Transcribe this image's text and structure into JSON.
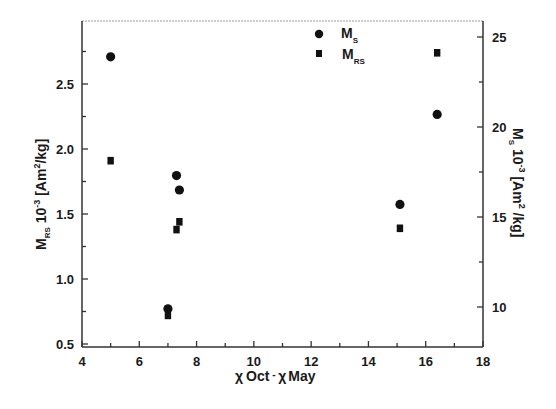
{
  "chart_data": {
    "type": "scatter",
    "title": "",
    "xlabel": "χ Oct - χ May",
    "ylabel_left": "M_RS 10^-3 [Am²/kg]",
    "ylabel_right": "M_S 10^-3 [Am²/kg]",
    "xlim": [
      4,
      18
    ],
    "ylim_left": [
      0.5,
      3.0
    ],
    "ylim_right": [
      8.3,
      26.3
    ],
    "x_ticks": [
      4,
      6,
      8,
      10,
      12,
      14,
      16,
      18
    ],
    "y_left_ticks": [
      0.5,
      1.0,
      1.5,
      2.0,
      2.5
    ],
    "y_right_ticks": [
      10,
      15,
      20,
      25
    ],
    "grid": false,
    "legend_position": "top-center-right",
    "series": [
      {
        "name": "M_S",
        "marker": "circle",
        "axis": "right",
        "points": [
          {
            "x": 5.0,
            "y": 23.9
          },
          {
            "x": 7.3,
            "y": 17.3
          },
          {
            "x": 7.4,
            "y": 16.5
          },
          {
            "x": 7.0,
            "y": 9.9
          },
          {
            "x": 15.1,
            "y": 15.7
          },
          {
            "x": 16.4,
            "y": 20.7
          }
        ]
      },
      {
        "name": "M_RS",
        "marker": "square",
        "axis": "left",
        "points": [
          {
            "x": 5.0,
            "y": 1.91
          },
          {
            "x": 7.3,
            "y": 1.38
          },
          {
            "x": 7.4,
            "y": 1.44
          },
          {
            "x": 7.0,
            "y": 0.72
          },
          {
            "x": 15.1,
            "y": 1.39
          },
          {
            "x": 16.4,
            "y": 2.74
          }
        ]
      }
    ]
  },
  "labels": {
    "x_axis": {
      "chi1": "χ",
      "oct": "Oct",
      "dash": " - ",
      "chi2": "χ",
      "may": "May"
    },
    "y_left": {
      "m": "M",
      "sub": "RS",
      "rest": " 10",
      "exp": "-3",
      "unit": " [Am",
      "sq": "2",
      "unit2": "/kg]"
    },
    "y_right": {
      "m": "M",
      "sub": "S",
      "rest": " 10",
      "exp": "-3",
      "unit": " [Am",
      "sq": "2",
      "unit2": " /kg]"
    },
    "legend": [
      {
        "m": "M",
        "sub": "S",
        "marker": "circle"
      },
      {
        "m": "M",
        "sub": "RS",
        "marker": "square"
      }
    ]
  },
  "colors": {
    "marker": "#111111",
    "axis": "#333333",
    "frame_top": "#9a9a9a"
  }
}
